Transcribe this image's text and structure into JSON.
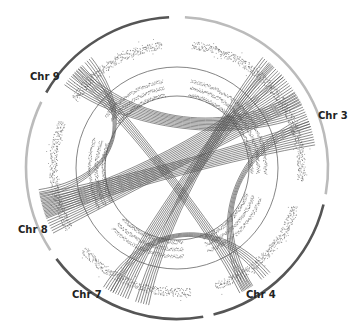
{
  "figure": {
    "type": "circos-genome-plot",
    "colors": {
      "dark_arc": "#555555",
      "light_arc": "#bbbbbb",
      "link": "#555555",
      "scatter": "#444444",
      "ring": "#666666"
    },
    "chromosomes": [
      {
        "name": "Chr 9",
        "label": "Chr 9",
        "start_deg": -60,
        "end_deg": -3,
        "shade": "dark"
      },
      {
        "name": "Chr 3",
        "label": "Chr 3",
        "start_deg": 3,
        "end_deg": 100,
        "shade": "light"
      },
      {
        "name": "Chr 4",
        "label": "Chr 4",
        "start_deg": 104,
        "end_deg": 166,
        "shade": "dark"
      },
      {
        "name": "Chr 7",
        "label": "Chr 7",
        "start_deg": 170,
        "end_deg": 233,
        "shade": "dark"
      },
      {
        "name": "Chr 8",
        "label": "Chr 8",
        "start_deg": 237,
        "end_deg": 296,
        "shade": "light"
      }
    ],
    "links": [
      {
        "from_deg": -48,
        "to_deg": 62,
        "count": 10
      },
      {
        "from_deg": -45,
        "to_deg": 150,
        "count": 6
      },
      {
        "from_deg": 250,
        "to_deg": 55,
        "count": 14
      },
      {
        "from_deg": 255,
        "to_deg": 75,
        "count": 10
      },
      {
        "from_deg": 205,
        "to_deg": 45,
        "count": 8
      },
      {
        "from_deg": 210,
        "to_deg": 140,
        "count": 5
      },
      {
        "from_deg": 195,
        "to_deg": 40,
        "count": 6
      },
      {
        "from_deg": 150,
        "to_deg": 70,
        "count": 5
      },
      {
        "from_deg": 260,
        "to_deg": -40,
        "count": 4
      }
    ]
  }
}
